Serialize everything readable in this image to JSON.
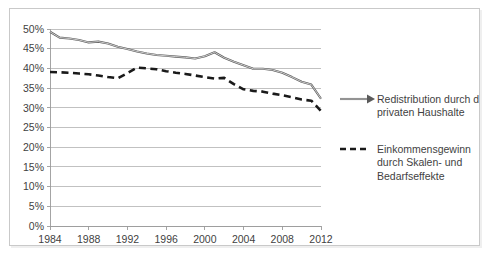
{
  "chart_data": {
    "type": "line",
    "title": "",
    "subtitle": "",
    "xlabel": "",
    "ylabel": "",
    "xlim": [
      1984,
      2012
    ],
    "ylim": [
      0,
      0.5
    ],
    "grid": true,
    "legend_position": "right",
    "y_tick_labels": [
      "50%",
      "45%",
      "40%",
      "35%",
      "30%",
      "25%",
      "20%",
      "15%",
      "10%",
      "5%",
      "0%"
    ],
    "y_tick_values": [
      0.5,
      0.45,
      0.4,
      0.35,
      0.3,
      0.25,
      0.2,
      0.15,
      0.1,
      0.05,
      0
    ],
    "x_tick_labels": [
      "1984",
      "1988",
      "1992",
      "1996",
      "2000",
      "2004",
      "2008",
      "2012"
    ],
    "x_tick_values": [
      1984,
      1988,
      1992,
      1996,
      2000,
      2004,
      2008,
      2012
    ],
    "x": [
      1984,
      1985,
      1986,
      1987,
      1988,
      1989,
      1990,
      1991,
      1992,
      1993,
      1994,
      1995,
      1996,
      1997,
      1998,
      1999,
      2000,
      2001,
      2002,
      2003,
      2004,
      2005,
      2006,
      2007,
      2008,
      2009,
      2010,
      2011,
      2012
    ],
    "series": [
      {
        "name": "Redistribution durch die privaten Haushalte",
        "style": "solid",
        "color": "#5a5a5a",
        "values": [
          0.493,
          0.478,
          0.476,
          0.472,
          0.466,
          0.468,
          0.463,
          0.455,
          0.449,
          0.443,
          0.438,
          0.434,
          0.432,
          0.43,
          0.428,
          0.425,
          0.431,
          0.441,
          0.427,
          0.417,
          0.408,
          0.399,
          0.399,
          0.396,
          0.389,
          0.378,
          0.366,
          0.359,
          0.323
        ]
      },
      {
        "name": "Einkommensgewinn durch Skalen- und Bedarfseffekte",
        "style": "dashed",
        "color": "#1a1a1a",
        "values": [
          0.391,
          0.39,
          0.389,
          0.387,
          0.385,
          0.382,
          0.378,
          0.375,
          0.388,
          0.402,
          0.4,
          0.398,
          0.393,
          0.389,
          0.386,
          0.382,
          0.378,
          0.374,
          0.376,
          0.36,
          0.347,
          0.343,
          0.341,
          0.336,
          0.332,
          0.327,
          0.321,
          0.318,
          0.292
        ]
      }
    ]
  },
  "legend": {
    "items": [
      {
        "label_line1": "Redistribution durch die",
        "label_line2": "privaten Haushalte",
        "style": "solid"
      },
      {
        "label_line1": "Einkommensgewinn",
        "label_line2": "durch Skalen- und",
        "label_line3": "Bedarfseffekte",
        "style": "dashed"
      }
    ]
  }
}
